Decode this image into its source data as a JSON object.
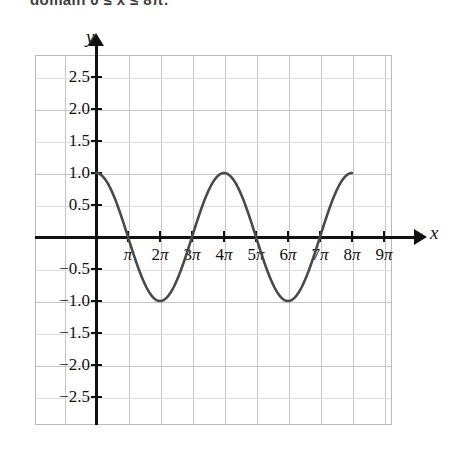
{
  "page": {
    "cut_off_header_text": "domain 0 ≤ x ≤ 8π."
  },
  "axes": {
    "x_axis_label": "x",
    "y_axis_label": "y"
  },
  "chart_data": {
    "type": "line",
    "title": "",
    "xlabel": "x",
    "ylabel": "y",
    "grid": true,
    "legend": null,
    "xlim": [
      -0.9,
      9.8
    ],
    "ylim": [
      -2.9,
      2.9
    ],
    "x_unit": "pi",
    "x_tick_labels": [
      "π",
      "2π",
      "3π",
      "4π",
      "5π",
      "6π",
      "7π",
      "8π",
      "9π"
    ],
    "x_tick_values": [
      1,
      2,
      3,
      4,
      5,
      6,
      7,
      8,
      9
    ],
    "y_tick_labels": [
      "2.5",
      "2.0",
      "1.5",
      "1.0",
      "0.5",
      "−0.5",
      "−1.0",
      "−1.5",
      "−2.0",
      "−2.5"
    ],
    "y_tick_values": [
      2.5,
      2.0,
      1.5,
      1.0,
      0.5,
      -0.5,
      -1.0,
      -1.5,
      -2.0,
      -2.5
    ],
    "series": [
      {
        "name": "y = cos(x/2)",
        "equation": "cos(x/2)",
        "domain_pi": [
          0,
          8
        ],
        "amplitude": 1,
        "period_pi": 4,
        "color": "#4a4a4a",
        "key_points": [
          {
            "x_pi": 0,
            "y": 1
          },
          {
            "x_pi": 1,
            "y": 0
          },
          {
            "x_pi": 2,
            "y": -1
          },
          {
            "x_pi": 3,
            "y": 0
          },
          {
            "x_pi": 4,
            "y": 1
          },
          {
            "x_pi": 5,
            "y": 0
          },
          {
            "x_pi": 6,
            "y": -1
          },
          {
            "x_pi": 7,
            "y": 0
          },
          {
            "x_pi": 8,
            "y": 1
          }
        ]
      }
    ]
  }
}
